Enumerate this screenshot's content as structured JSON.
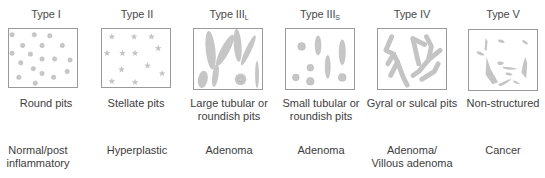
{
  "figure": {
    "shape_color": "#c4c4c4",
    "border_color": "#9a9a9a",
    "columns": [
      {
        "type_main": "Type I",
        "type_sub": "",
        "pattern": "round-pits",
        "description": "Round pits",
        "diagnosis_line1": "Normal/post",
        "diagnosis_line2": "inflammatory"
      },
      {
        "type_main": "Type II",
        "type_sub": "",
        "pattern": "stellate-pits",
        "description": "Stellate pits",
        "diagnosis_line1": "Hyperplastic",
        "diagnosis_line2": ""
      },
      {
        "type_main": "Type III",
        "type_sub": "L",
        "pattern": "large-tubular-pits",
        "description": "Large tubular or roundish pits",
        "diagnosis_line1": "Adenoma",
        "diagnosis_line2": ""
      },
      {
        "type_main": "Type III",
        "type_sub": "S",
        "pattern": "small-tubular-pits",
        "description": "Small tubular or roundish pits",
        "diagnosis_line1": "Adenoma",
        "diagnosis_line2": ""
      },
      {
        "type_main": "Type IV",
        "type_sub": "",
        "pattern": "gyral-pits",
        "description": "Gyral or sulcal pits",
        "diagnosis_line1": "Adenoma/",
        "diagnosis_line2": "Villous adenoma"
      },
      {
        "type_main": "Type V",
        "type_sub": "",
        "pattern": "non-structured",
        "description": "Non-structured",
        "diagnosis_line1": "Cancer",
        "diagnosis_line2": ""
      }
    ]
  }
}
